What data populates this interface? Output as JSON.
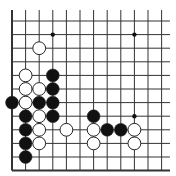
{
  "diagram": {
    "type": "go-board-fragment",
    "edges": [
      "left",
      "bottom"
    ],
    "columns": 12,
    "rows": 12,
    "origin_x": 12,
    "origin_y": 21,
    "spacing": 13.6,
    "colors": {
      "background": "#ffffff",
      "line": "#333333",
      "black_stone": "#111111",
      "white_stone": "#ffffff",
      "stone_outline": "#222222"
    },
    "star_points": [
      {
        "col": 3,
        "row": 1
      },
      {
        "col": 9,
        "row": 1
      },
      {
        "col": 9,
        "row": 7
      }
    ],
    "stones": [
      {
        "color": "white",
        "col": 2,
        "row": 2
      },
      {
        "color": "white",
        "col": 1,
        "row": 4
      },
      {
        "color": "black",
        "col": 3,
        "row": 4
      },
      {
        "color": "white",
        "col": 1,
        "row": 5
      },
      {
        "color": "white",
        "col": 2,
        "row": 5
      },
      {
        "color": "black",
        "col": 3,
        "row": 5
      },
      {
        "color": "black",
        "col": 0,
        "row": 6
      },
      {
        "color": "white",
        "col": 1,
        "row": 6
      },
      {
        "color": "black",
        "col": 2,
        "row": 6
      },
      {
        "color": "black",
        "col": 3,
        "row": 6
      },
      {
        "color": "black",
        "col": 1,
        "row": 7
      },
      {
        "color": "white",
        "col": 2,
        "row": 7
      },
      {
        "color": "black",
        "col": 3,
        "row": 7
      },
      {
        "color": "black",
        "col": 6,
        "row": 7
      },
      {
        "color": "black",
        "col": 1,
        "row": 8
      },
      {
        "color": "white",
        "col": 2,
        "row": 8
      },
      {
        "color": "white",
        "col": 4,
        "row": 8
      },
      {
        "color": "white",
        "col": 6,
        "row": 8
      },
      {
        "color": "black",
        "col": 7,
        "row": 8
      },
      {
        "color": "black",
        "col": 8,
        "row": 8
      },
      {
        "color": "white",
        "col": 9,
        "row": 8
      },
      {
        "color": "black",
        "col": 1,
        "row": 9
      },
      {
        "color": "white",
        "col": 2,
        "row": 9
      },
      {
        "color": "white",
        "col": 6,
        "row": 9
      },
      {
        "color": "white",
        "col": 9,
        "row": 9
      },
      {
        "color": "black",
        "col": 1,
        "row": 10
      }
    ]
  }
}
